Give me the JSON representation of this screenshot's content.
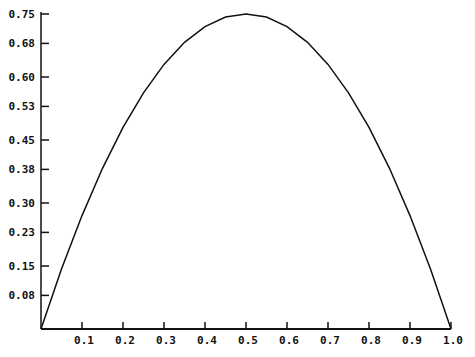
{
  "chart_data": {
    "type": "line",
    "title": "",
    "xlabel": "",
    "ylabel": "",
    "xlim": [
      0,
      1.0
    ],
    "ylim": [
      0,
      0.75
    ],
    "grid": false,
    "legend": null,
    "x_ticks": [
      "0.1",
      "0.2",
      "0.3",
      "0.4",
      "0.5",
      "0.6",
      "0.7",
      "0.8",
      "0.9",
      "1.0"
    ],
    "y_ticks": [
      "0.08",
      "0.15",
      "0.23",
      "0.30",
      "0.38",
      "0.45",
      "0.53",
      "0.60",
      "0.68",
      "0.75"
    ],
    "series": [
      {
        "name": "f(x)",
        "x": [
          0.0,
          0.05,
          0.1,
          0.15,
          0.2,
          0.25,
          0.3,
          0.35,
          0.4,
          0.45,
          0.5,
          0.55,
          0.6,
          0.65,
          0.7,
          0.75,
          0.8,
          0.85,
          0.9,
          0.95,
          1.0
        ],
        "values": [
          0.0,
          0.1425,
          0.27,
          0.3825,
          0.48,
          0.5625,
          0.63,
          0.6825,
          0.72,
          0.7425,
          0.75,
          0.7425,
          0.72,
          0.6825,
          0.63,
          0.5625,
          0.48,
          0.3825,
          0.27,
          0.1425,
          0.0
        ]
      }
    ]
  },
  "colors": {
    "line": "#111111",
    "axis": "#111111",
    "background": "#ffffff"
  }
}
